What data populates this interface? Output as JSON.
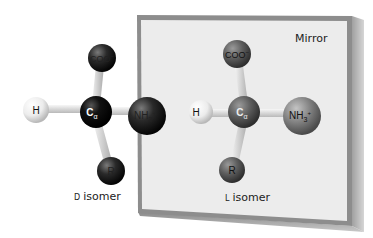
{
  "mirror": {
    "label": "Mirror"
  },
  "d_isomer": {
    "caption_prefix": "D",
    "caption": "isomer",
    "atoms": {
      "top": "COO",
      "top_sup": "−",
      "left": "H",
      "center": "C",
      "center_sub": "α",
      "right": "NH",
      "right_sub": "3",
      "right_sup": "+",
      "bottom": "R"
    }
  },
  "l_isomer": {
    "caption_prefix": "L",
    "caption": "isomer",
    "atoms": {
      "top": "COO",
      "top_sup": "−",
      "left": "H",
      "center": "C",
      "center_sub": "α",
      "right": "NH",
      "right_sub": "3",
      "right_sup": "+",
      "bottom": "R"
    }
  },
  "colors": {
    "mirror_face": "#ececec",
    "mirror_frame": "#8f8f8f",
    "d_atoms_dark": "#1a1a1a",
    "l_atoms_mid": "#7a7a7a",
    "hydrogen": "#f2f2f2",
    "bond": "#dcdcdc"
  }
}
